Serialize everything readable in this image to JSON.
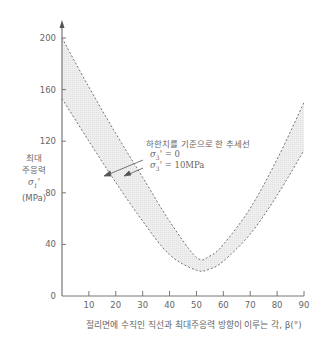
{
  "chart_data": {
    "type": "area",
    "title": "",
    "xlabel": "절리면에 수직인 직선과 최대주응력 방향이 이루는 각, β(°)",
    "ylabel": [
      "최대",
      "주응력",
      "σ1'",
      "(MPa)"
    ],
    "xlim": [
      0,
      90
    ],
    "ylim": [
      0,
      200
    ],
    "x_ticks": [
      10,
      20,
      30,
      40,
      50,
      60,
      70,
      80,
      90
    ],
    "y_ticks": [
      0,
      40,
      80,
      120,
      160,
      200
    ],
    "grid": false,
    "band_label": "하한치를 기준으로 한 추세선",
    "series": [
      {
        "name": "σ3' = 0",
        "style": "dashed",
        "x": [
          0,
          10,
          20,
          30,
          40,
          50,
          55,
          60,
          70,
          80,
          90
        ],
        "values": [
          153,
          120,
          88,
          58,
          32,
          20,
          21,
          27,
          48,
          78,
          113
        ]
      },
      {
        "name": "σ3' = 10MPa",
        "style": "dashed",
        "x": [
          0,
          10,
          20,
          30,
          40,
          50,
          55,
          60,
          70,
          80,
          90
        ],
        "values": [
          200,
          162,
          126,
          92,
          58,
          30,
          31,
          40,
          68,
          106,
          150
        ]
      }
    ],
    "annotations": [
      {
        "text": "σ3' = 0",
        "points_to": "σ3' = 0"
      },
      {
        "text": "σ3' = 10MPa",
        "points_to": "σ3' = 10MPa"
      }
    ]
  },
  "labels": {
    "y_title_1": "최대",
    "y_title_2": "주응력",
    "y_title_3": "σ",
    "y_title_3_sub": "1",
    "y_title_4": "(MPa)",
    "x_title": "절리면에 수직인 직선과 최대주응력 방향이 이루는 각, β(°)",
    "band_title": "하한치를 기준으로 한 추세선",
    "legend_0_sym": "σ",
    "legend_0_sub": "3",
    "legend_0_val": "= 0",
    "legend_1_sym": "σ",
    "legend_1_sub": "3",
    "legend_1_val": "= 10MPa"
  },
  "colors": {
    "axis": "#888888",
    "dash": "#666666",
    "band": "#ececec"
  }
}
